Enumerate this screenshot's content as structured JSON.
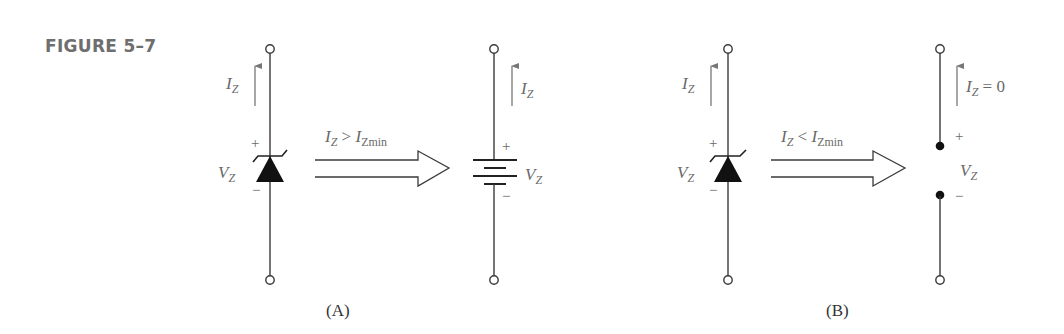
{
  "figure": {
    "label": "FIGURE 5–7"
  },
  "panel_a": {
    "caption": "(A)",
    "zener": {
      "current_label": "I",
      "current_sub": "Z",
      "voltage_label": "V",
      "voltage_sub": "Z",
      "plus": "+",
      "minus": "−"
    },
    "arrow": {
      "cond_i": "I",
      "cond_i_sub": "Z",
      "cond_op": " > ",
      "cond_r": "I",
      "cond_r_sub": "Zmin"
    },
    "equivalent": {
      "type": "battery",
      "current_label": "I",
      "current_sub": "Z",
      "voltage_label": "V",
      "voltage_sub": "Z",
      "plus": "+",
      "minus": "−"
    }
  },
  "panel_b": {
    "caption": "(B)",
    "zener": {
      "current_label": "I",
      "current_sub": "Z",
      "voltage_label": "V",
      "voltage_sub": "Z",
      "plus": "+",
      "minus": "−"
    },
    "arrow": {
      "cond_i": "I",
      "cond_i_sub": "Z",
      "cond_op": " < ",
      "cond_r": "I",
      "cond_r_sub": "Zmin"
    },
    "equivalent": {
      "type": "open-circuit",
      "current_label": "I",
      "current_sub": "Z",
      "current_value": " = 0",
      "voltage_label": "V",
      "voltage_sub": "Z",
      "plus": "+",
      "minus": "−"
    }
  },
  "colors": {
    "wire": "#3a3a3a",
    "label": "#6a6a6a",
    "figure_label": "#6e6e6e"
  }
}
